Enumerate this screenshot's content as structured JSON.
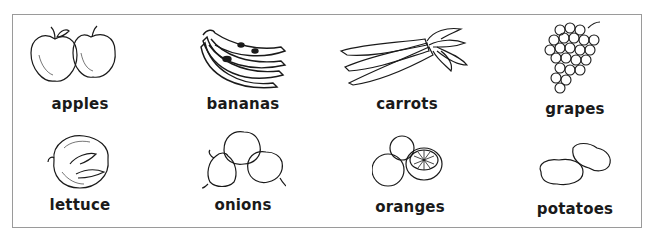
{
  "items": [
    {
      "label": "apples",
      "icon": "apples-icon"
    },
    {
      "label": "bananas",
      "icon": "bananas-icon"
    },
    {
      "label": "carrots",
      "icon": "carrots-icon"
    },
    {
      "label": "grapes",
      "icon": "grapes-icon"
    },
    {
      "label": "lettuce",
      "icon": "lettuce-icon"
    },
    {
      "label": "onions",
      "icon": "onions-icon"
    },
    {
      "label": "oranges",
      "icon": "oranges-icon"
    },
    {
      "label": "potatoes",
      "icon": "potatoes-icon"
    }
  ],
  "colors": {
    "stroke": "#1a1a1a",
    "border": "#9a9a9a",
    "background": "#ffffff"
  }
}
